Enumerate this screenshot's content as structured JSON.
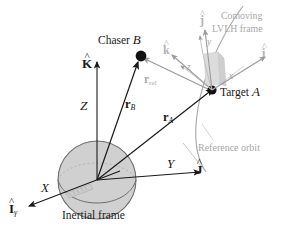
{
  "figure": {
    "background": "#ffffff",
    "colors": {
      "ink": "#1a1a1a",
      "gray_text": "#a8a8a8",
      "gray_line": "#9a9a9a",
      "earth_fill": "#d0d0d0",
      "earth_stroke": "#6d6d6d",
      "spacecraft_fill": "#d8d8d8",
      "orbit_stroke": "#a0a0a0"
    },
    "labels": {
      "chaser": "Chaser",
      "chaser_body": "B",
      "target": "Target",
      "target_body": "A",
      "comoving_line1": "Comoving",
      "comoving_line2": "LVLH frame",
      "reference_orbit": "Reference orbit",
      "inertial_frame": "Inertial frame",
      "axis_Z": "Z",
      "axis_X": "X",
      "axis_Y": "Y",
      "unit_K": "K",
      "unit_I": "I",
      "unit_J": "J",
      "unit_i": "i",
      "unit_j": "j",
      "unit_k": "k",
      "local_x": "x",
      "local_y": "y",
      "local_z": "z",
      "vec_rB": "r",
      "vec_rB_sub": "B",
      "vec_rA": "r",
      "vec_rA_sub": "A",
      "vec_rrel": "r",
      "vec_rrel_sub": "rel",
      "hat_mark": "^",
      "gamma": "γ"
    }
  }
}
